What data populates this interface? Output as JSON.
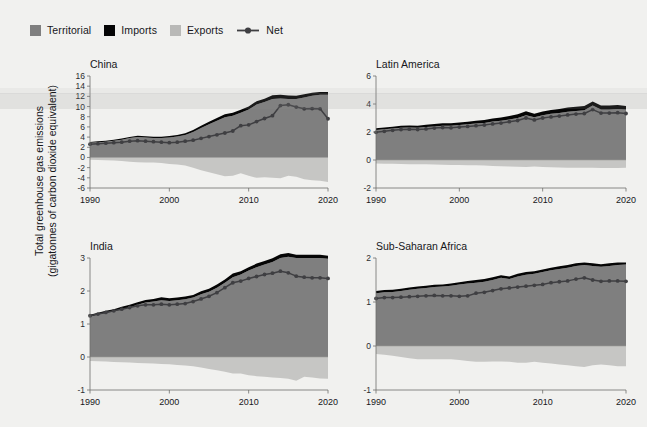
{
  "figure": {
    "ylabel_line1": "Total greenhouse gas emissions",
    "ylabel_line2": "(gigatonnes of carbon dioxide equivalent)",
    "background_color": "#f1f1ef"
  },
  "legend": {
    "position": "top-left",
    "items": [
      {
        "label": "Territorial",
        "color": "#7f7f7f",
        "marker": "square"
      },
      {
        "label": "Imports",
        "color": "#050505",
        "marker": "square"
      },
      {
        "label": "Exports",
        "color": "#b9b9b7",
        "marker": "square"
      },
      {
        "label": "Net",
        "color": "#3f3f42",
        "marker": "line-with-dot"
      }
    ]
  },
  "chart_data": [
    {
      "type": "area",
      "title": "China",
      "xlabel": "",
      "ylabel": "Total greenhouse gas emissions (gigatonnes of carbon dioxide equivalent)",
      "x": [
        1990,
        1991,
        1992,
        1993,
        1994,
        1995,
        1996,
        1997,
        1998,
        1999,
        2000,
        2001,
        2002,
        2003,
        2004,
        2005,
        2006,
        2007,
        2008,
        2009,
        2010,
        2011,
        2012,
        2013,
        2014,
        2015,
        2016,
        2017,
        2018,
        2019,
        2020
      ],
      "xlim": [
        1990,
        2020
      ],
      "ylim": [
        -6,
        16
      ],
      "yticks": [
        -6,
        -4,
        -2,
        0,
        2,
        4,
        6,
        8,
        10,
        12,
        14,
        16
      ],
      "xticks": [
        1990,
        2000,
        2010,
        2020
      ],
      "grid": false,
      "series": [
        {
          "name": "Territorial",
          "color": "#7f7f7f",
          "values": [
            2.9,
            3.0,
            3.1,
            3.3,
            3.5,
            3.8,
            4.0,
            3.9,
            3.8,
            3.8,
            3.9,
            4.1,
            4.4,
            5.0,
            5.8,
            6.5,
            7.2,
            7.9,
            8.2,
            8.8,
            9.4,
            10.4,
            10.9,
            11.5,
            11.6,
            11.5,
            11.5,
            11.8,
            12.1,
            12.3,
            12.3
          ]
        },
        {
          "name": "Imports",
          "color": "#050505",
          "values": [
            0.15,
            0.16,
            0.17,
            0.18,
            0.2,
            0.22,
            0.24,
            0.25,
            0.26,
            0.27,
            0.3,
            0.32,
            0.35,
            0.4,
            0.45,
            0.5,
            0.55,
            0.6,
            0.6,
            0.55,
            0.6,
            0.65,
            0.65,
            0.7,
            0.7,
            0.65,
            0.62,
            0.6,
            0.6,
            0.58,
            0.55
          ]
        },
        {
          "name": "Exports",
          "color": "#c6c6c4",
          "values": [
            -0.45,
            -0.5,
            -0.55,
            -0.6,
            -0.7,
            -0.85,
            -0.95,
            -1.0,
            -1.0,
            -1.1,
            -1.3,
            -1.4,
            -1.6,
            -2.0,
            -2.5,
            -2.9,
            -3.3,
            -3.7,
            -3.6,
            -3.1,
            -3.6,
            -4.0,
            -3.9,
            -4.0,
            -4.1,
            -3.6,
            -3.8,
            -4.3,
            -4.5,
            -4.6,
            -4.8
          ]
        },
        {
          "name": "Net",
          "color": "#3f3f42",
          "values": [
            2.6,
            2.7,
            2.8,
            2.9,
            3.0,
            3.2,
            3.3,
            3.2,
            3.1,
            3.0,
            2.9,
            3.0,
            3.2,
            3.4,
            3.75,
            4.1,
            4.45,
            4.8,
            5.2,
            6.25,
            6.4,
            7.05,
            7.65,
            8.2,
            10.2,
            10.35,
            9.9,
            9.55,
            9.6,
            9.55,
            7.6
          ]
        }
      ]
    },
    {
      "type": "area",
      "title": "Latin America",
      "xlabel": "",
      "ylabel": "",
      "x": [
        1990,
        1991,
        1992,
        1993,
        1994,
        1995,
        1996,
        1997,
        1998,
        1999,
        2000,
        2001,
        2002,
        2003,
        2004,
        2005,
        2006,
        2007,
        2008,
        2009,
        2010,
        2011,
        2012,
        2013,
        2014,
        2015,
        2016,
        2017,
        2018,
        2019,
        2020
      ],
      "xlim": [
        1990,
        2020
      ],
      "ylim": [
        -2,
        6
      ],
      "yticks": [
        -2,
        0,
        2,
        4,
        6
      ],
      "xticks": [
        1990,
        2000,
        2010,
        2020
      ],
      "grid": false,
      "series": [
        {
          "name": "Territorial",
          "color": "#7f7f7f",
          "values": [
            2.15,
            2.2,
            2.25,
            2.3,
            2.32,
            2.3,
            2.35,
            2.4,
            2.45,
            2.45,
            2.5,
            2.55,
            2.6,
            2.65,
            2.75,
            2.8,
            2.9,
            3.0,
            3.2,
            3.05,
            3.2,
            3.3,
            3.35,
            3.45,
            3.5,
            3.55,
            3.9,
            3.6,
            3.6,
            3.65,
            3.6
          ]
        },
        {
          "name": "Imports",
          "color": "#050505",
          "values": [
            0.12,
            0.12,
            0.13,
            0.14,
            0.15,
            0.15,
            0.16,
            0.17,
            0.18,
            0.17,
            0.18,
            0.19,
            0.2,
            0.2,
            0.22,
            0.24,
            0.25,
            0.26,
            0.28,
            0.25,
            0.27,
            0.28,
            0.29,
            0.3,
            0.3,
            0.3,
            0.28,
            0.3,
            0.3,
            0.28,
            0.26
          ]
        },
        {
          "name": "Exports",
          "color": "#c6c6c4",
          "values": [
            -0.25,
            -0.26,
            -0.27,
            -0.28,
            -0.3,
            -0.3,
            -0.31,
            -0.33,
            -0.34,
            -0.35,
            -0.36,
            -0.37,
            -0.38,
            -0.4,
            -0.42,
            -0.44,
            -0.46,
            -0.48,
            -0.5,
            -0.46,
            -0.5,
            -0.52,
            -0.53,
            -0.55,
            -0.56,
            -0.55,
            -0.56,
            -0.57,
            -0.58,
            -0.58,
            -0.55
          ]
        },
        {
          "name": "Net",
          "color": "#3f3f42",
          "values": [
            1.98,
            2.05,
            2.12,
            2.18,
            2.2,
            2.18,
            2.22,
            2.28,
            2.32,
            2.3,
            2.35,
            2.4,
            2.45,
            2.5,
            2.58,
            2.64,
            2.74,
            2.82,
            3.0,
            2.86,
            3.0,
            3.08,
            3.14,
            3.22,
            3.28,
            3.32,
            3.6,
            3.35,
            3.35,
            3.38,
            3.32
          ]
        }
      ]
    },
    {
      "type": "area",
      "title": "India",
      "xlabel": "",
      "ylabel": "",
      "x": [
        1990,
        1991,
        1992,
        1993,
        1994,
        1995,
        1996,
        1997,
        1998,
        1999,
        2000,
        2001,
        2002,
        2003,
        2004,
        2005,
        2006,
        2007,
        2008,
        2009,
        2010,
        2011,
        2012,
        2013,
        2014,
        2015,
        2016,
        2017,
        2018,
        2019,
        2020
      ],
      "xlim": [
        1990,
        2020
      ],
      "ylim": [
        -1,
        3
      ],
      "yticks": [
        -1,
        0,
        1,
        2,
        3
      ],
      "xticks": [
        1990,
        2000,
        2010,
        2020
      ],
      "grid": false,
      "series": [
        {
          "name": "Territorial",
          "color": "#7f7f7f",
          "values": [
            1.22,
            1.28,
            1.33,
            1.38,
            1.45,
            1.5,
            1.58,
            1.65,
            1.68,
            1.72,
            1.7,
            1.72,
            1.75,
            1.8,
            1.9,
            1.98,
            2.1,
            2.25,
            2.42,
            2.5,
            2.62,
            2.72,
            2.8,
            2.88,
            3.0,
            3.04,
            3.0,
            3.0,
            3.0,
            3.0,
            2.98
          ]
        },
        {
          "name": "Imports",
          "color": "#050505",
          "values": [
            0.06,
            0.06,
            0.07,
            0.07,
            0.07,
            0.08,
            0.08,
            0.08,
            0.08,
            0.09,
            0.08,
            0.08,
            0.08,
            0.08,
            0.09,
            0.09,
            0.1,
            0.1,
            0.11,
            0.1,
            0.1,
            0.11,
            0.11,
            0.11,
            0.11,
            0.11,
            0.1,
            0.1,
            0.1,
            0.1,
            0.09
          ]
        },
        {
          "name": "Exports",
          "color": "#c6c6c4",
          "values": [
            -0.12,
            -0.13,
            -0.14,
            -0.15,
            -0.16,
            -0.17,
            -0.18,
            -0.19,
            -0.2,
            -0.21,
            -0.22,
            -0.24,
            -0.26,
            -0.28,
            -0.32,
            -0.36,
            -0.4,
            -0.45,
            -0.5,
            -0.5,
            -0.55,
            -0.58,
            -0.6,
            -0.62,
            -0.64,
            -0.66,
            -0.72,
            -0.6,
            -0.62,
            -0.65,
            -0.66
          ]
        },
        {
          "name": "Net",
          "color": "#3f3f42",
          "values": [
            1.25,
            1.3,
            1.35,
            1.4,
            1.45,
            1.5,
            1.55,
            1.58,
            1.58,
            1.6,
            1.58,
            1.6,
            1.62,
            1.68,
            1.76,
            1.84,
            1.95,
            2.1,
            2.25,
            2.3,
            2.38,
            2.44,
            2.5,
            2.54,
            2.6,
            2.55,
            2.45,
            2.42,
            2.4,
            2.4,
            2.38
          ]
        }
      ]
    },
    {
      "type": "area",
      "title": "Sub-Saharan Africa",
      "xlabel": "",
      "ylabel": "",
      "x": [
        1990,
        1991,
        1992,
        1993,
        1994,
        1995,
        1996,
        1997,
        1998,
        1999,
        2000,
        2001,
        2002,
        2003,
        2004,
        2005,
        2006,
        2007,
        2008,
        2009,
        2010,
        2011,
        2012,
        2013,
        2014,
        2015,
        2016,
        2017,
        2018,
        2019,
        2020
      ],
      "xlim": [
        1990,
        2020
      ],
      "ylim": [
        -1,
        2
      ],
      "yticks": [
        -1,
        0,
        1,
        2
      ],
      "xticks": [
        1990,
        2000,
        2010,
        2020
      ],
      "grid": false,
      "series": [
        {
          "name": "Territorial",
          "color": "#7f7f7f",
          "values": [
            1.2,
            1.22,
            1.23,
            1.25,
            1.28,
            1.3,
            1.32,
            1.34,
            1.35,
            1.37,
            1.4,
            1.42,
            1.44,
            1.46,
            1.5,
            1.55,
            1.52,
            1.58,
            1.62,
            1.64,
            1.68,
            1.72,
            1.75,
            1.78,
            1.82,
            1.84,
            1.82,
            1.8,
            1.82,
            1.84,
            1.85
          ]
        },
        {
          "name": "Imports",
          "color": "#050505",
          "values": [
            0.05,
            0.05,
            0.05,
            0.05,
            0.05,
            0.05,
            0.05,
            0.05,
            0.05,
            0.05,
            0.05,
            0.06,
            0.06,
            0.06,
            0.06,
            0.06,
            0.06,
            0.06,
            0.06,
            0.06,
            0.06,
            0.06,
            0.06,
            0.06,
            0.06,
            0.06,
            0.06,
            0.06,
            0.06,
            0.06,
            0.05
          ]
        },
        {
          "name": "Exports",
          "color": "#c6c6c4",
          "values": [
            -0.18,
            -0.2,
            -0.22,
            -0.25,
            -0.28,
            -0.3,
            -0.3,
            -0.3,
            -0.3,
            -0.3,
            -0.32,
            -0.34,
            -0.36,
            -0.36,
            -0.35,
            -0.35,
            -0.36,
            -0.38,
            -0.38,
            -0.36,
            -0.38,
            -0.4,
            -0.42,
            -0.44,
            -0.46,
            -0.48,
            -0.44,
            -0.42,
            -0.44,
            -0.46,
            -0.46
          ]
        },
        {
          "name": "Net",
          "color": "#3f3f42",
          "values": [
            1.08,
            1.1,
            1.1,
            1.11,
            1.12,
            1.13,
            1.14,
            1.15,
            1.14,
            1.14,
            1.13,
            1.14,
            1.2,
            1.22,
            1.26,
            1.3,
            1.32,
            1.34,
            1.36,
            1.38,
            1.4,
            1.44,
            1.46,
            1.48,
            1.52,
            1.55,
            1.5,
            1.47,
            1.48,
            1.48,
            1.47
          ]
        }
      ]
    }
  ]
}
